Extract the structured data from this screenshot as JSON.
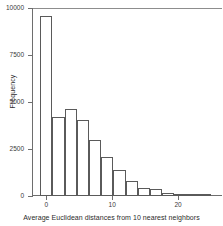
{
  "chart_data": {
    "type": "bar",
    "title": "",
    "subtitle": "",
    "xlabel": "Average Euclidean distances from 10 nearest neighbors",
    "ylabel": "Frequency",
    "xlim": [
      -2.0,
      26.5
    ],
    "ylim": [
      0,
      10000
    ],
    "xticks": [
      0,
      10,
      20
    ],
    "xtick_labels": [
      "0",
      "10",
      "20"
    ],
    "yticks": [
      0,
      2500,
      5000,
      7500,
      10000
    ],
    "ytick_labels": [
      "0",
      "2500",
      "5000",
      "7500",
      "10000"
    ],
    "grid": false,
    "legend": null,
    "bin_width": 1.85,
    "bin_starts": [
      -0.9,
      0.95,
      2.8,
      4.65,
      6.5,
      8.35,
      10.2,
      12.05,
      13.9,
      15.75,
      17.6,
      19.45,
      21.3,
      23.15
    ],
    "categories": [
      "-0.9-1.0",
      "1.0-2.8",
      "2.8-4.7",
      "4.7-6.5",
      "6.5-8.4",
      "8.4-10.2",
      "10.2-12.1",
      "12.1-13.9",
      "13.9-15.8",
      "15.8-17.6",
      "17.6-19.5",
      "19.5-21.3",
      "21.3-23.2",
      "23.2-25.0"
    ],
    "values": [
      9550,
      4200,
      4650,
      4050,
      3000,
      2100,
      1400,
      800,
      450,
      350,
      150,
      60,
      20,
      5
    ],
    "bar_face_color": "#ffffff",
    "bar_edge_color": "#5a5a5a",
    "axis_color": "#6e6e6e",
    "text_color": "#2b2b2b",
    "background_color": "#ffffff"
  }
}
